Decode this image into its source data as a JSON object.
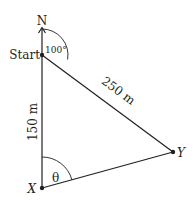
{
  "diagram": {
    "type": "geometry-bearing",
    "points": {
      "start": {
        "label": "Start",
        "x": 42,
        "y": 55
      },
      "x": {
        "label": "X",
        "x": 42,
        "y": 188
      },
      "y": {
        "label": "Y",
        "x": 173,
        "y": 152
      }
    },
    "north_label": "N",
    "angles": {
      "start_bearing": "100°",
      "theta": "θ"
    },
    "sides": {
      "start_to_x": "150 m",
      "start_to_y": "250 m"
    },
    "colors": {
      "line": "#231f20",
      "background": "#ffffff"
    }
  }
}
